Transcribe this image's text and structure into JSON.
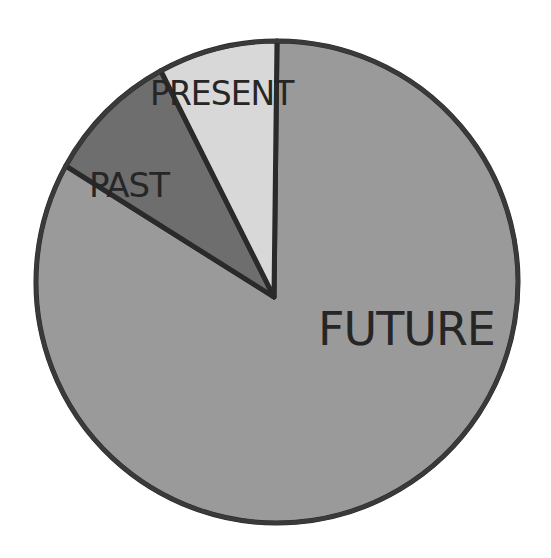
{
  "chart_data": {
    "type": "pie",
    "title": "",
    "start_angle_deg": 0,
    "direction": "clockwise-from-top",
    "slices": [
      {
        "label": "FUTURE",
        "value": 83,
        "color": "#9a9a9a"
      },
      {
        "label": "PAST",
        "value": 9,
        "color": "#6e6e6e"
      },
      {
        "label": "PRESENT",
        "value": 8,
        "color": "#d8d8d8"
      }
    ],
    "categories": [
      "FUTURE",
      "PAST",
      "PRESENT"
    ],
    "values": [
      83,
      9,
      8
    ],
    "legend": "none",
    "labels_position": "inside"
  },
  "labels": {
    "future": "FUTURE",
    "past": "PAST",
    "present": "PRESENT"
  }
}
